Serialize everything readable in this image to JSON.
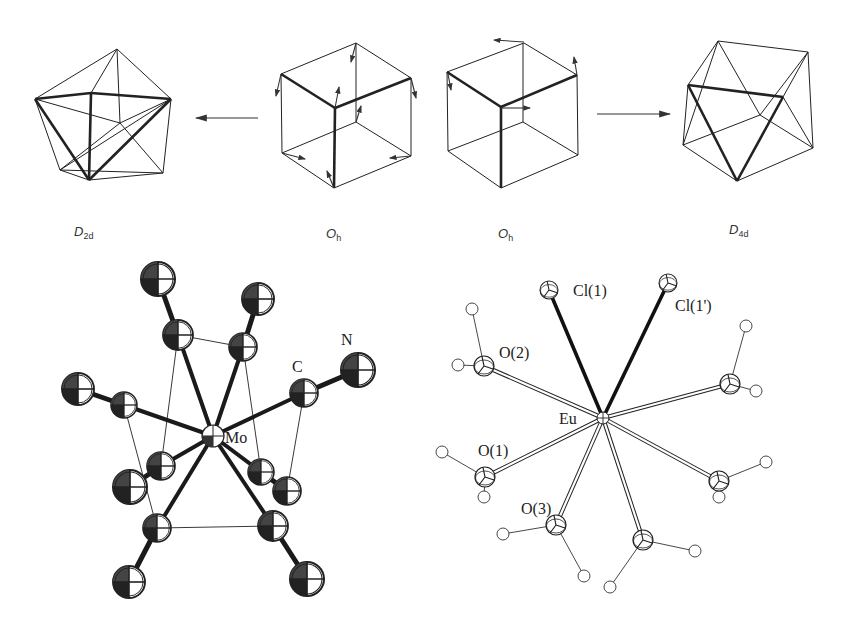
{
  "figure": {
    "top_row": {
      "polyhedra": [
        {
          "id": "d2d",
          "symmetry": "D",
          "subscript": "2d",
          "label_x": 80
        },
        {
          "id": "oh_left",
          "symmetry": "O",
          "subscript": "h",
          "label_x": 331
        },
        {
          "id": "oh_right",
          "symmetry": "O",
          "subscript": "h",
          "label_x": 499
        },
        {
          "id": "d4d",
          "symmetry": "D",
          "subscript": "4d",
          "label_x": 732
        }
      ],
      "arrows": [
        {
          "from": "oh_left",
          "to": "d2d",
          "direction": "left"
        },
        {
          "from": "oh_right",
          "to": "d4d",
          "direction": "right"
        }
      ]
    },
    "bottom_left": {
      "title": "Mo(CN)8 complex",
      "labels": {
        "metal": "Mo",
        "carbon": "C",
        "nitrogen": "N"
      }
    },
    "bottom_right": {
      "title": "EuCl2(H2O)6 complex",
      "labels": {
        "metal": "Eu",
        "cl1": "Cl(1)",
        "cl1p": "Cl(1')",
        "o1": "O(1)",
        "o2": "O(2)",
        "o3": "O(3)"
      }
    }
  }
}
